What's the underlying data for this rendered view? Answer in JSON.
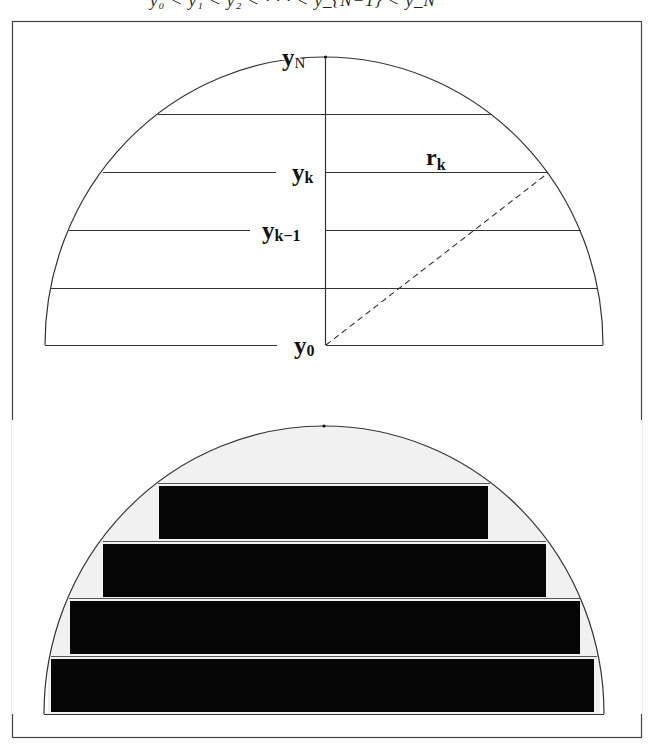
{
  "header_equation": "y₀ < y₁ < y₂ < · · · < y_{N−1} < y_N",
  "top_panel": {
    "labels": {
      "y_N": {
        "main": "y",
        "sub": "N"
      },
      "y_k": {
        "main": "y",
        "sub": "k"
      },
      "y_k_minus_1": {
        "main": "y",
        "sub": "k−1"
      },
      "y_0": {
        "main": "y",
        "sub": "0"
      },
      "r_k": {
        "main": "r",
        "sub": "k"
      }
    },
    "description": "Semicircle sliced into horizontal strips at y0..yN with dashed radius r_k"
  },
  "bottom_panel": {
    "description": "Semicircle approximated by stacked inscribed black rectangles",
    "bar_count": 4
  },
  "colors": {
    "line": "#333333",
    "bar_fill": "#050505",
    "shading": "#eeeeee",
    "frame": "#444444"
  }
}
